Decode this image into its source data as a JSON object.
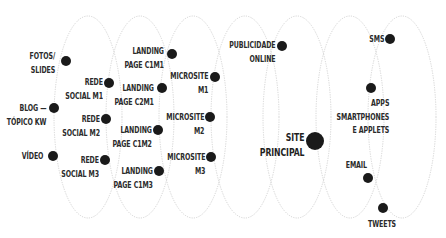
{
  "diagram": {
    "ellipse_style": {
      "stroke": "#c9c9c9",
      "dashed": true
    },
    "dot_color": "#1a1a1a",
    "ellipses": [
      {
        "cx": 88,
        "cy": 117,
        "rx": 34,
        "ry": 101
      },
      {
        "cx": 140,
        "cy": 117,
        "rx": 34,
        "ry": 101
      },
      {
        "cx": 193,
        "cy": 117,
        "rx": 34,
        "ry": 101
      },
      {
        "cx": 245,
        "cy": 117,
        "rx": 34,
        "ry": 101
      },
      {
        "cx": 297,
        "cy": 117,
        "rx": 34,
        "ry": 101
      },
      {
        "cx": 350,
        "cy": 117,
        "rx": 34,
        "ry": 101
      },
      {
        "cx": 402,
        "cy": 117,
        "rx": 34,
        "ry": 101
      }
    ],
    "nodes": [
      {
        "id": "fotos-slides",
        "lines": [
          "FOTOS/",
          "SLIDES"
        ],
        "dot": {
          "x": 66,
          "y": 61,
          "r": 5
        }
      },
      {
        "id": "rede-social-m1",
        "lines": [
          "REDE",
          "SOCIAL M1"
        ],
        "dot": {
          "x": 109,
          "y": 83,
          "r": 5
        }
      },
      {
        "id": "blog-topico-kw",
        "lines": [
          "BLOG —",
          "TÓPICO KW"
        ],
        "dot": {
          "x": 54,
          "y": 108,
          "r": 5
        }
      },
      {
        "id": "rede-social-m2",
        "lines": [
          "REDE",
          "SOCIAL M2"
        ],
        "dot": {
          "x": 106,
          "y": 119,
          "r": 5
        }
      },
      {
        "id": "video",
        "lines": [
          "VÍDEO"
        ],
        "dot": {
          "x": 53,
          "y": 156,
          "r": 5
        }
      },
      {
        "id": "rede-social-m3",
        "lines": [
          "REDE",
          "SOCIAL M3"
        ],
        "dot": {
          "x": 105,
          "y": 160,
          "r": 5
        }
      },
      {
        "id": "landing-page-c1m1",
        "lines": [
          "LANDING",
          "PAGE C1M1"
        ],
        "dot": {
          "x": 172,
          "y": 54,
          "r": 5
        }
      },
      {
        "id": "landing-page-c2m1",
        "lines": [
          "LANDING",
          "PAGE C2M1"
        ],
        "dot": {
          "x": 162,
          "y": 88,
          "r": 5
        }
      },
      {
        "id": "landing-page-c1m2",
        "lines": [
          "LANDING",
          "PAGE C1M2"
        ],
        "dot": {
          "x": 158,
          "y": 130,
          "r": 5
        }
      },
      {
        "id": "landing-page-c1m3",
        "lines": [
          "LANDING",
          "PAGE C1M3"
        ],
        "dot": {
          "x": 159,
          "y": 171,
          "r": 5
        }
      },
      {
        "id": "microsite-m1",
        "lines": [
          "MICROSITE",
          "M1"
        ],
        "dot": {
          "x": 215,
          "y": 77,
          "r": 5
        }
      },
      {
        "id": "microsite-m2",
        "lines": [
          "MICROSITE",
          "M2"
        ],
        "dot": {
          "x": 210,
          "y": 117,
          "r": 5
        }
      },
      {
        "id": "microsite-m3",
        "lines": [
          "MICROSITE",
          "M3"
        ],
        "dot": {
          "x": 211,
          "y": 157,
          "r": 5
        }
      },
      {
        "id": "publicidade-online",
        "lines": [
          "PUBLICIDADE",
          "ONLINE"
        ],
        "dot": {
          "x": 282,
          "y": 46,
          "r": 5
        }
      },
      {
        "id": "site-principal",
        "lines": [
          "SITE",
          "PRINCIPAL"
        ],
        "dot": {
          "x": 315,
          "y": 141,
          "r": 9
        }
      },
      {
        "id": "sms",
        "lines": [
          "SMS"
        ],
        "dot": {
          "x": 390,
          "y": 39,
          "r": 5
        }
      },
      {
        "id": "apps-smartphones-applets",
        "lines": [
          "APPS",
          "SMARTPHONES",
          "E APPLETS"
        ],
        "dot": {
          "x": 371,
          "y": 88,
          "r": 5
        }
      },
      {
        "id": "email",
        "lines": [
          "EMAIL"
        ],
        "dot": {
          "x": 368,
          "y": 178,
          "r": 5
        }
      },
      {
        "id": "tweets",
        "lines": [
          "TWEETS"
        ],
        "dot": {
          "x": 383,
          "y": 208,
          "r": 5
        }
      }
    ]
  }
}
